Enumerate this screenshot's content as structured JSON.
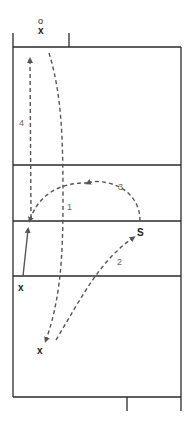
{
  "diagram": {
    "colors": {
      "court_line": "#2a2a2a",
      "dashed_path": "#555555",
      "solid_arrow": "#555555",
      "number": "#666666"
    },
    "labels": {
      "top_player_o": "o",
      "top_player_x": "x",
      "server": "S",
      "player_left": "x",
      "player_bottom": "x",
      "path_1": "1",
      "path_2": "2",
      "path_3": "3",
      "path_4": "4"
    },
    "paths": [
      {
        "id": 1,
        "style": "dashed",
        "description": "from top near net-side down to bottom player"
      },
      {
        "id": 2,
        "style": "dashed",
        "description": "from bottom player to server S"
      },
      {
        "id": 3,
        "style": "dashed",
        "description": "arc from S to left at net"
      },
      {
        "id": 4,
        "style": "dashed",
        "description": "from left at net up toward top"
      },
      {
        "id": 5,
        "style": "solid",
        "description": "from left x up to net"
      }
    ]
  }
}
